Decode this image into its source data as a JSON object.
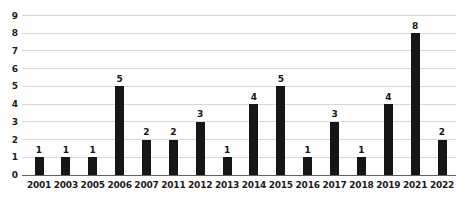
{
  "chart_data": {
    "type": "bar",
    "categories": [
      "2001",
      "2003",
      "2005",
      "2006",
      "2007",
      "2011",
      "2012",
      "2013",
      "2014",
      "2015",
      "2016",
      "2017",
      "2018",
      "2019",
      "2021",
      "2022"
    ],
    "values": [
      1,
      1,
      1,
      5,
      2,
      2,
      3,
      1,
      4,
      5,
      1,
      3,
      1,
      4,
      8,
      2
    ],
    "title": "",
    "xlabel": "",
    "ylabel": "",
    "ylim": [
      0,
      9
    ],
    "yticks": [
      0,
      1,
      2,
      3,
      4,
      5,
      6,
      7,
      8,
      9
    ],
    "grid": true,
    "legend": false,
    "data_labels": true,
    "bar_color": "#161616",
    "grid_color": "#d7d7d7",
    "axis_color": "#5f5f5f",
    "label_color": "#1c1c1c"
  }
}
